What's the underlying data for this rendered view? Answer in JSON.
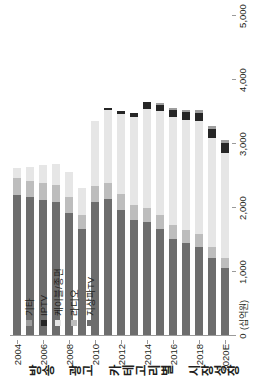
{
  "chart_data": {
    "type": "bar",
    "orientation": "horizontal-stacked",
    "title": "방송 광고 카테고리별 시장성장",
    "unit_label": "(십억원)",
    "xlabel": "",
    "ylabel": "",
    "xlim": [
      0,
      5000
    ],
    "xticks": [
      0,
      1000,
      2000,
      3000,
      4000,
      5000
    ],
    "xticklabels": [
      "0",
      "1,000",
      "2,000",
      "3,000",
      "4,000",
      "5,000"
    ],
    "grid": false,
    "legend_position": "upper-left",
    "categories": [
      "2004",
      "2005",
      "2006",
      "2007",
      "2008",
      "2009",
      "2010",
      "2011",
      "2012",
      "2013",
      "2014",
      "2015",
      "2016",
      "2017",
      "2018",
      "2019",
      "2020E"
    ],
    "category_ticklabels": [
      "2004",
      "",
      "2006",
      "",
      "2008",
      "",
      "2010",
      "",
      "2012",
      "",
      "2014",
      "",
      "2016",
      "",
      "2018",
      "",
      "2020E"
    ],
    "series": [
      {
        "name": "지상파TV",
        "color": "#6d6d6d",
        "values": [
          2190,
          2150,
          2110,
          2080,
          1900,
          1650,
          2080,
          2130,
          1960,
          1800,
          1760,
          1650,
          1500,
          1430,
          1380,
          1200,
          1050
        ]
      },
      {
        "name": "라디오",
        "color": "#bdbdbd",
        "values": [
          260,
          260,
          270,
          260,
          250,
          220,
          250,
          250,
          240,
          230,
          230,
          230,
          220,
          210,
          200,
          180,
          160
        ]
      },
      {
        "name": "케이블/종편",
        "color": "#e6e6e6",
        "values": [
          160,
          210,
          280,
          340,
          400,
          420,
          1010,
          1130,
          1250,
          1380,
          1540,
          1620,
          1680,
          1720,
          1760,
          1700,
          1640
        ]
      },
      {
        "name": "IPTV",
        "color": "#262626",
        "values": [
          0,
          0,
          0,
          0,
          0,
          0,
          0,
          40,
          50,
          60,
          110,
          90,
          110,
          120,
          130,
          140,
          150
        ]
      },
      {
        "name": "기타",
        "color": "#9e9e9e",
        "values": [
          0,
          0,
          0,
          0,
          0,
          0,
          0,
          0,
          0,
          0,
          0,
          30,
          40,
          40,
          40,
          40,
          40
        ]
      }
    ],
    "totals": [
      2610,
      2620,
      2660,
      2680,
      2550,
      2290,
      3340,
      3550,
      3500,
      3470,
      3640,
      3620,
      3550,
      3520,
      3510,
      3260,
      3040
    ]
  },
  "legend": {
    "items": [
      {
        "label": "기타",
        "color": "#9e9e9e"
      },
      {
        "label": "IPTV",
        "color": "#262626"
      },
      {
        "label": "케이블/종편",
        "color": "#e6e6e6"
      },
      {
        "label": "라디오",
        "color": "#bdbdbd"
      },
      {
        "label": "지상파TV",
        "color": "#6d6d6d"
      }
    ]
  }
}
